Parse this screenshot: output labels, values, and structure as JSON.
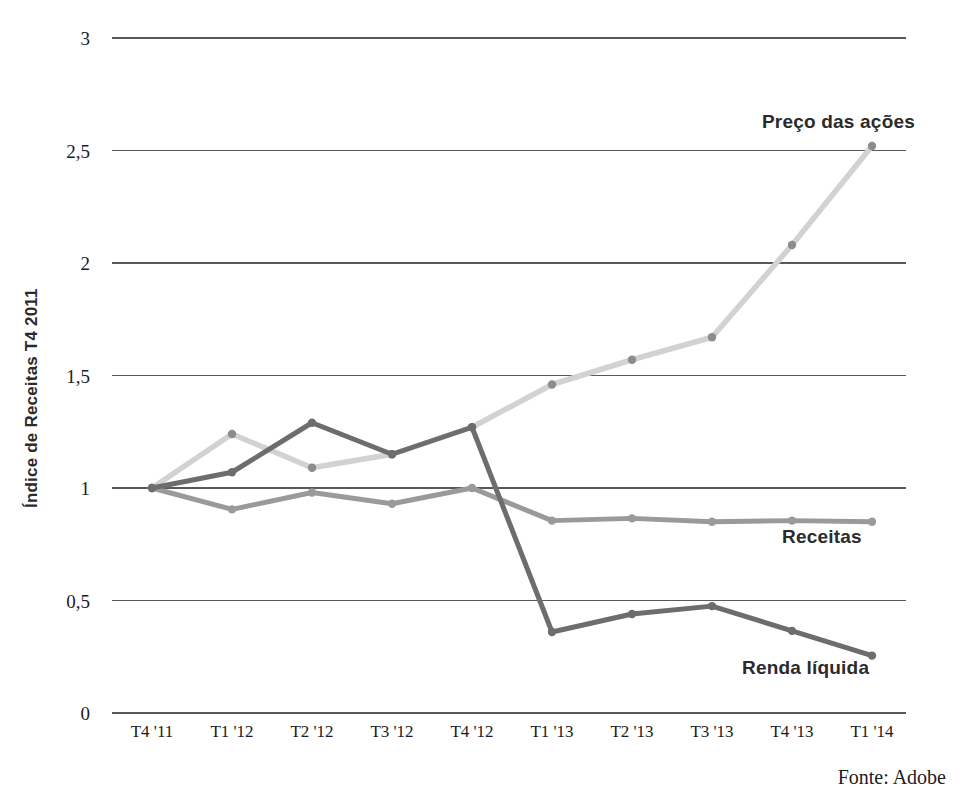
{
  "chart_data": {
    "type": "line",
    "title": "",
    "xlabel": "",
    "ylabel": "Índice de Receitas T4 2011",
    "categories": [
      "T4 '11",
      "T1 '12",
      "T2 '12",
      "T3 '12",
      "T4 '12",
      "T1 '13",
      "T2 '13",
      "T3 '13",
      "T4 '13",
      "T1 '14"
    ],
    "ylim": [
      0,
      3
    ],
    "yticks": [
      0,
      0.5,
      1,
      1.5,
      2,
      2.5,
      3
    ],
    "ytick_labels": [
      "0",
      "0,5",
      "1",
      "1,5",
      "2",
      "2,5",
      "3"
    ],
    "grid": true,
    "legend_position": "inline-end-of-line",
    "series": [
      {
        "name": "Preço das ações",
        "color": "#d2d2d2",
        "marker_color": "#8c8c8c",
        "values": [
          1.0,
          1.24,
          1.09,
          1.15,
          1.27,
          1.46,
          1.57,
          1.67,
          2.08,
          2.52
        ]
      },
      {
        "name": "Receitas",
        "color": "#9a9a9a",
        "marker_color": "#9a9a9a",
        "values": [
          1.0,
          0.905,
          0.98,
          0.93,
          1.0,
          0.855,
          0.865,
          0.85,
          0.855,
          0.85
        ]
      },
      {
        "name": "Renda líquida",
        "color": "#6d6d6d",
        "marker_color": "#6d6d6d",
        "values": [
          1.0,
          1.07,
          1.29,
          1.15,
          1.27,
          0.36,
          0.44,
          0.475,
          0.365,
          0.255
        ]
      }
    ],
    "annotations": [
      {
        "text": "Preço das ações",
        "x": 0.0,
        "y": 0.0
      },
      {
        "text": "Receitas",
        "x": 0.0,
        "y": 0.0
      },
      {
        "text": "Renda líquida",
        "x": 0.0,
        "y": 0.0
      }
    ]
  },
  "source": {
    "text": "Fonte: Adobe"
  }
}
